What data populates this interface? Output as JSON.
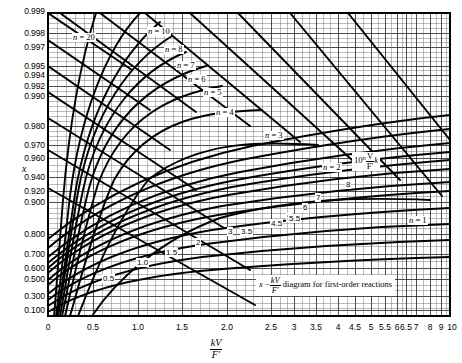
{
  "chart_data": {
    "type": "line",
    "xlabel_numerator": "kV",
    "xlabel_denominator": "F′",
    "ylabel": "x",
    "xscale": "piecewise-linear (compressed above 2.5)",
    "yscale": "logit / probability",
    "xlim": [
      0,
      10
    ],
    "ylim": [
      0.1,
      0.999
    ],
    "grid": true,
    "legend_position": "inline curve labels",
    "x_tick_labels": [
      "0",
      "0.5",
      "1.0",
      "1.5",
      "2.0",
      "2.5",
      "3",
      "3.5",
      "4",
      "4.5",
      "5",
      "5.5",
      "6",
      "6.5",
      "7",
      "8",
      "9",
      "10"
    ],
    "x_tick_values": [
      0,
      0.5,
      1.0,
      1.5,
      2.0,
      2.5,
      3,
      3.5,
      4,
      4.5,
      5,
      5.5,
      6,
      6.5,
      7,
      8,
      9,
      10
    ],
    "y_tick_labels": [
      "0.999",
      "0.998",
      "0.997",
      "0.995",
      "0.994",
      "0.992",
      "0.990",
      "0.980",
      "0.970",
      "0.960",
      "0.940",
      "0.920",
      "0.900",
      "0.800",
      "0.700",
      "0.600",
      "0.500",
      "0.300",
      "0.100"
    ],
    "y_tick_values": [
      0.999,
      0.998,
      0.997,
      0.995,
      0.994,
      0.992,
      0.99,
      0.98,
      0.97,
      0.96,
      0.94,
      0.92,
      0.9,
      0.8,
      0.7,
      0.6,
      0.5,
      0.3,
      0.1
    ],
    "annotation_formula_prefix": "10",
    "annotation_formula_exponent": "n",
    "annotation_formula_numerator": "V",
    "annotation_formula_denominator": "F′",
    "annotation_formula_suffix": "k",
    "caption_lead": "x",
    "caption_minus": "−",
    "caption_num": "kV",
    "caption_den": "F′",
    "caption_tail": "diagram for first-order reactions",
    "n_series": [
      {
        "name": "n = 1",
        "n": 1,
        "label": "n = 1"
      },
      {
        "name": "n = 2",
        "n": 2,
        "label": "n = 2"
      },
      {
        "name": "n = 3",
        "n": 3,
        "label": "n = 3"
      },
      {
        "name": "n = 4",
        "n": 4,
        "label": "n = 4"
      },
      {
        "name": "n = 5",
        "n": 5,
        "label": "n = 5"
      },
      {
        "name": "n = 6",
        "n": 6,
        "label": "n = 6"
      },
      {
        "name": "n = 7",
        "n": 7,
        "label": "n = 7"
      },
      {
        "name": "n = 8",
        "n": 8,
        "label": "n = 8"
      },
      {
        "name": "n = 10",
        "n": 10,
        "label": "n = 10"
      },
      {
        "name": "n = 20",
        "n": 20,
        "label": "n = 20"
      }
    ],
    "tau_series": [
      {
        "name": "0.5",
        "value": 0.5
      },
      {
        "name": "1.0",
        "value": 1.0
      },
      {
        "name": "1.5",
        "value": 1.5
      },
      {
        "name": "2",
        "value": 2.0
      },
      {
        "name": "3",
        "value": 3.0
      },
      {
        "name": "3.5",
        "value": 3.5
      },
      {
        "name": "4.5",
        "value": 4.5
      },
      {
        "name": "5",
        "value": 5.0
      },
      {
        "name": "5.5",
        "value": 5.5
      },
      {
        "name": "6",
        "value": 6.0
      },
      {
        "name": "7",
        "value": 7.0
      },
      {
        "name": "8",
        "value": 8.0
      }
    ],
    "line_color": "#000000",
    "grid_color": "#555555",
    "background_color": "#ffffff"
  },
  "axes": {
    "y_ticks": [
      {
        "label": "0.999",
        "top": 11
      },
      {
        "label": "0.998",
        "top": 33
      },
      {
        "label": "0.997",
        "top": 47
      },
      {
        "label": "0.995",
        "top": 66
      },
      {
        "label": "0.994",
        "top": 75
      },
      {
        "label": "0.992",
        "top": 86
      },
      {
        "label": "0.990",
        "top": 96
      },
      {
        "label": "0.980",
        "top": 126
      },
      {
        "label": "0.970",
        "top": 145
      },
      {
        "label": "0.960",
        "top": 158
      },
      {
        "label": "0.940",
        "top": 177
      },
      {
        "label": "0.920",
        "top": 191
      },
      {
        "label": "0.900",
        "top": 202
      },
      {
        "label": "0.800",
        "top": 234
      },
      {
        "label": "0.700",
        "top": 254
      },
      {
        "label": "0.600",
        "top": 268
      },
      {
        "label": "0.500",
        "top": 279
      },
      {
        "label": "0.300",
        "top": 296
      },
      {
        "label": "0.100",
        "top": 310
      }
    ],
    "x_ticks": [
      {
        "label": "0",
        "left": 48
      },
      {
        "label": "0.5",
        "left": 93
      },
      {
        "label": "1.0",
        "left": 138
      },
      {
        "label": "1.5",
        "left": 182
      },
      {
        "label": "2.0",
        "left": 227
      },
      {
        "label": "2.5",
        "left": 271
      },
      {
        "label": "3",
        "left": 294
      },
      {
        "label": "3.5",
        "left": 316
      },
      {
        "label": "4",
        "left": 338
      },
      {
        "label": "4.5",
        "left": 355
      },
      {
        "label": "5",
        "left": 371
      },
      {
        "label": "5.5",
        "left": 385
      },
      {
        "label": "6",
        "left": 397
      },
      {
        "label": "6.5",
        "left": 406
      },
      {
        "label": "7",
        "left": 416
      },
      {
        "label": "8",
        "left": 430
      },
      {
        "label": "9",
        "left": 441
      },
      {
        "label": "10",
        "left": 452
      }
    ]
  },
  "n_labels": [
    {
      "text": "n = 20",
      "left": 72,
      "top": 33
    },
    {
      "text": "n = 10",
      "left": 147,
      "top": 27
    },
    {
      "text": "n = 8",
      "left": 164,
      "top": 45
    },
    {
      "text": "n = 7",
      "left": 176,
      "top": 61
    },
    {
      "text": "n = 6",
      "left": 187,
      "top": 75
    },
    {
      "text": "n = 5",
      "left": 203,
      "top": 88
    },
    {
      "text": "n = 4",
      "left": 215,
      "top": 108
    },
    {
      "text": "n = 3",
      "left": 264,
      "top": 131
    },
    {
      "text": "n = 2",
      "left": 322,
      "top": 163
    },
    {
      "text": "n = 1",
      "left": 408,
      "top": 216
    }
  ],
  "curve_labels": [
    {
      "text": "0.5",
      "left": 102,
      "top": 274
    },
    {
      "text": "1.0",
      "left": 136,
      "top": 258
    },
    {
      "text": "1.5",
      "left": 165,
      "top": 248
    },
    {
      "text": "2",
      "left": 195,
      "top": 238
    },
    {
      "text": "3",
      "left": 227,
      "top": 227
    },
    {
      "text": "3.5",
      "left": 240,
      "top": 227
    },
    {
      "text": "4.5",
      "left": 270,
      "top": 219
    },
    {
      "text": "5",
      "left": 286,
      "top": 213
    },
    {
      "text": "5.5",
      "left": 288,
      "top": 214
    },
    {
      "text": "6",
      "left": 302,
      "top": 203
    },
    {
      "text": "7",
      "left": 315,
      "top": 193
    },
    {
      "text": "8",
      "left": 345,
      "top": 180
    }
  ]
}
